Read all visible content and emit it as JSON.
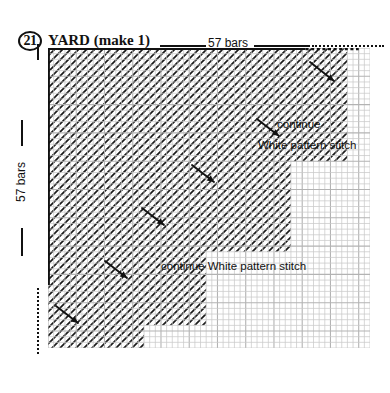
{
  "header": {
    "step_number": "21",
    "title": "YARD (make 1)",
    "top_count_label": "57 bars",
    "side_count_label": "57 bars"
  },
  "annotations": [
    {
      "id": "continue",
      "text": "continue"
    },
    {
      "id": "white-pattern-stitch",
      "text": "White pattern stitch"
    },
    {
      "id": "continue-white-pattern-stitch",
      "text": "continue White pattern stitch"
    }
  ],
  "chart_data": {
    "type": "heatmap",
    "title": "YARD (make 1)",
    "xlabel": "57 bars",
    "ylabel": "57 bars",
    "grid": true,
    "columns": 57,
    "rows": 53,
    "cell_px": 5.65,
    "legend": [
      "hatched = White pattern stitch"
    ],
    "fill_rows": [
      53,
      53,
      53,
      53,
      53,
      53,
      53,
      53,
      53,
      53,
      53,
      53,
      53,
      53,
      53,
      53,
      53,
      53,
      53,
      53,
      43,
      43,
      43,
      43,
      43,
      43,
      43,
      43,
      43,
      43,
      43,
      43,
      43,
      43,
      43,
      43,
      28,
      28,
      28,
      28,
      28,
      28,
      28,
      28,
      28,
      28,
      28,
      28,
      28,
      17,
      17,
      17,
      17,
      17,
      17,
      17,
      17,
      17,
      17,
      17,
      10,
      10,
      10,
      10,
      10,
      10,
      10,
      10,
      0,
      0,
      0,
      0,
      0
    ],
    "note": "fill_rows[i] = number of hatched cells counted from left edge on chart row i (top to bottom); staircase descends left/down"
  },
  "colors": {
    "ink": "#111111",
    "grid_line": "#c9c9c9",
    "grid_line_major": "#b3b3b3",
    "hatch": "#1a1a1a",
    "hatch_bg": "#ffffff",
    "page_bg": "#ffffff"
  }
}
